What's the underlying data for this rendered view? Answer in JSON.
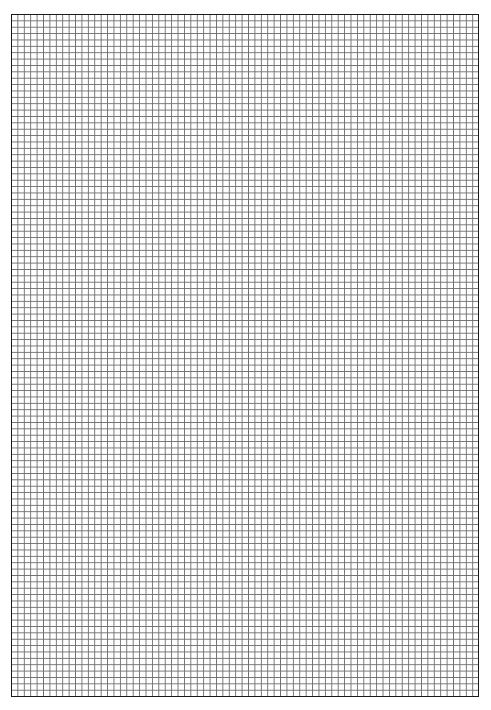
{
  "page": {
    "type": "grid-paper",
    "grid": {
      "columns": 73,
      "rows": 107,
      "line_color": "#6e6e6e",
      "border_color": "#1a1a1a",
      "background": "#ffffff"
    }
  }
}
